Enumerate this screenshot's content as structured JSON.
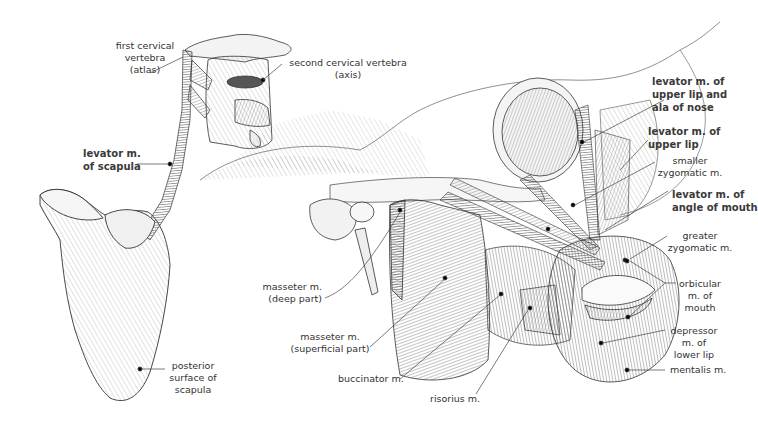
{
  "figure": {
    "background": "#ffffff",
    "ink_color": "#222222",
    "label_color": "#333333"
  },
  "labels": {
    "first_cervical_vertebra": [
      "first cervical",
      "vertebra",
      "(atlas)"
    ],
    "second_cervical_vertebra": [
      "second cervical vertebra",
      "(axis)"
    ],
    "levator_scapula": [
      "levator m.",
      "of scapula"
    ],
    "posterior_surface_scapula": [
      "posterior",
      "surface of",
      "scapula"
    ],
    "levator_upper_lip_ala_nose": [
      "levator m. of",
      "upper lip and",
      "ala of nose"
    ],
    "levator_upper_lip": [
      "levator m. of",
      "upper lip"
    ],
    "smaller_zygomatic": [
      "smaller",
      "zygomatic m."
    ],
    "levator_angle_mouth": [
      "levator m. of",
      "angle of mouth"
    ],
    "greater_zygomatic": [
      "greater",
      "zygomatic m."
    ],
    "orbicular_mouth": [
      "orbicular",
      "m. of",
      "mouth"
    ],
    "depressor_lower_lip": [
      "depressor",
      "m. of",
      "lower lip"
    ],
    "mentalis": [
      "mentalis m."
    ],
    "masseter_deep": [
      "masseter m.",
      "(deep part)"
    ],
    "masseter_superficial": [
      "masseter m.",
      "(superficial part)"
    ],
    "buccinator": [
      "buccinator m."
    ],
    "risorius": [
      "risorius m."
    ]
  }
}
